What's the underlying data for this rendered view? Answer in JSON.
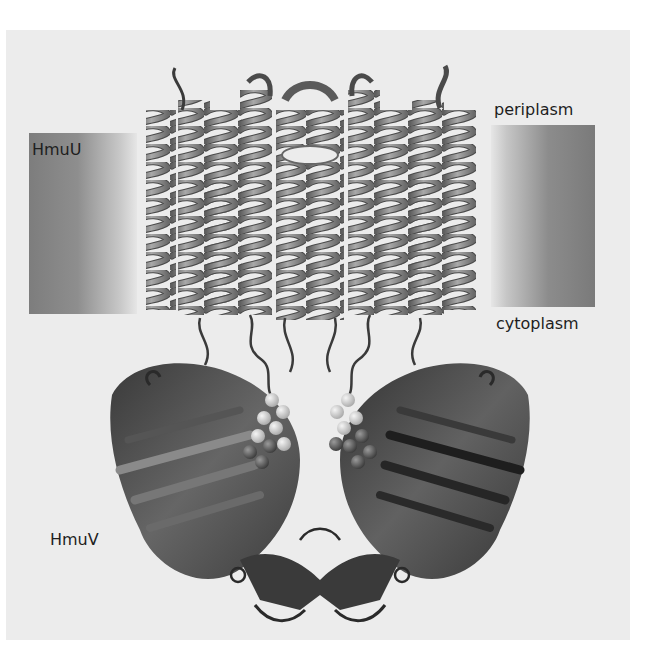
{
  "figure": {
    "labels": {
      "transmembrane_domain": "HmuU",
      "nucleotide_binding_domain": "HmuV",
      "membrane_top": "periplasm",
      "membrane_bottom": "cytoplasm"
    },
    "colors": {
      "background": "#ececec",
      "membrane_dark": "#7d7d7d",
      "membrane_light": "#e6e6e6",
      "helix_ribbon": "#8a8a8a",
      "nbd_ribbon": "#3c3c3c",
      "ligand_spheres_light": "#d8d8d8",
      "ligand_spheres_dark": "#5a5a5a",
      "text": "#1e1e1e"
    }
  }
}
